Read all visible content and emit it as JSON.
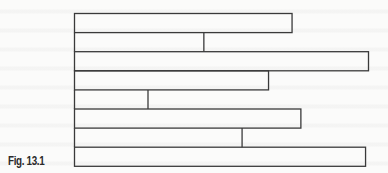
{
  "caption": "Fig. 13.1",
  "diagram": {
    "type": "stacked-bar-outline",
    "line_color": "#3a3a3a",
    "bars": [
      {
        "row": 1,
        "relative_length": 0.74,
        "end_style": "box"
      },
      {
        "row": 2,
        "relative_length": 0.44,
        "end_style": "divider"
      },
      {
        "row": 3,
        "relative_length": 1.0,
        "end_style": "box"
      },
      {
        "row": 4,
        "relative_length": 0.66,
        "end_style": "box"
      },
      {
        "row": 5,
        "relative_length": 0.25,
        "end_style": "divider"
      },
      {
        "row": 6,
        "relative_length": 0.77,
        "end_style": "box"
      },
      {
        "row": 7,
        "relative_length": 0.57,
        "end_style": "divider"
      },
      {
        "row": 8,
        "relative_length": 0.99,
        "end_style": "box"
      }
    ]
  }
}
